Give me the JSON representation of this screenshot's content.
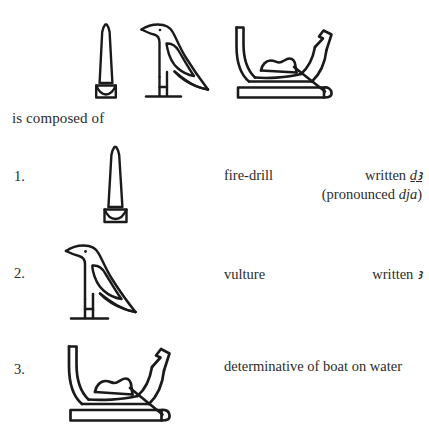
{
  "page": {
    "background_color": "#ffffff",
    "ink_color": "#1a1a1a",
    "text_color": "#2b2b2b"
  },
  "headword": {
    "description": "Egyptian word written with three hieroglyphs",
    "glyphs": [
      {
        "name": "fire-drill-glyph",
        "gardiner": "U28",
        "label": "fire-drill"
      },
      {
        "name": "vulture-glyph",
        "gardiner": "G1",
        "label": "vulture"
      },
      {
        "name": "boat-on-water-glyph",
        "gardiner": "P1",
        "label": "boat on water"
      }
    ]
  },
  "intro": {
    "text": "is composed of"
  },
  "entries": [
    {
      "number": "1.",
      "glyph_name": "fire-drill-glyph",
      "gloss": "fire-drill",
      "written_prefix": "written ",
      "written_value": "ḏꜣ",
      "pronounced_open": "(pronounced ",
      "pronounced_value": "dja",
      "pronounced_close": ")"
    },
    {
      "number": "2.",
      "glyph_name": "vulture-glyph",
      "gloss": "vulture",
      "written_prefix": "written ",
      "written_value": "ꜣ"
    },
    {
      "number": "3.",
      "glyph_name": "boat-on-water-glyph",
      "gloss": "determinative of boat on water"
    }
  ]
}
